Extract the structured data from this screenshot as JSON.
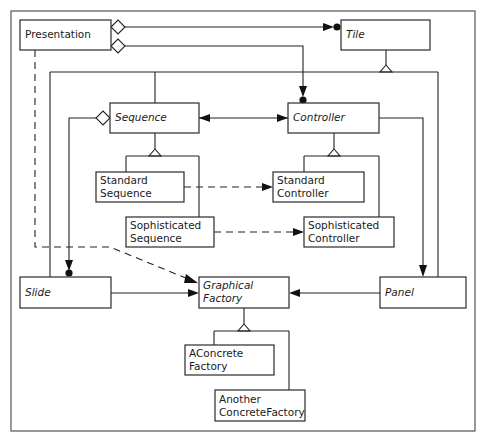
{
  "diagram": {
    "title": "",
    "classes": {
      "presentation": {
        "name": "Presentation",
        "abstract": false
      },
      "tile": {
        "name": "Tile",
        "abstract": true
      },
      "sequence": {
        "name": "Sequence",
        "abstract": true
      },
      "controller": {
        "name": "Controller",
        "abstract": true
      },
      "standard_sequence": {
        "line1": "Standard",
        "line2": "Sequence",
        "abstract": false
      },
      "sophisticated_sequence": {
        "line1": "Sophisticated",
        "line2": "Sequence",
        "abstract": false
      },
      "standard_controller": {
        "line1": "Standard",
        "line2": "Controller",
        "abstract": false
      },
      "sophisticated_controller": {
        "line1": "Sophisticated",
        "line2": "Controller",
        "abstract": false
      },
      "slide": {
        "name": "Slide",
        "abstract": true
      },
      "graphical_factory": {
        "line1": "Graphical",
        "line2": "Factory",
        "abstract": true
      },
      "panel": {
        "name": "Panel",
        "abstract": true
      },
      "aconcrete_factory": {
        "line1": "AConcrete",
        "line2": "Factory",
        "abstract": false
      },
      "another_concrete_factory": {
        "line1": "Another",
        "line2": "ConcreteFactory",
        "abstract": false
      }
    },
    "relationships": [
      {
        "type": "aggregation-many",
        "from": "Presentation",
        "to": "Tile"
      },
      {
        "type": "aggregation-many",
        "from": "Presentation",
        "to": "Controller"
      },
      {
        "type": "dependency",
        "from": "Presentation",
        "to": "Graphical Factory"
      },
      {
        "type": "generalization",
        "parent": "Tile",
        "children": [
          "Sequence",
          "Controller",
          "Slide",
          "Panel"
        ]
      },
      {
        "type": "association-bidirectional",
        "from": "Sequence",
        "to": "Controller"
      },
      {
        "type": "aggregation-many",
        "from": "Sequence",
        "to": "Slide"
      },
      {
        "type": "generalization",
        "parent": "Sequence",
        "children": [
          "Standard Sequence",
          "Sophisticated Sequence"
        ]
      },
      {
        "type": "generalization",
        "parent": "Controller",
        "children": [
          "Standard Controller",
          "Sophisticated Controller"
        ]
      },
      {
        "type": "dependency",
        "from": "Standard Sequence",
        "to": "Standard Controller"
      },
      {
        "type": "dependency",
        "from": "Sophisticated Sequence",
        "to": "Sophisticated Controller"
      },
      {
        "type": "association",
        "from": "Controller",
        "to": "Panel"
      },
      {
        "type": "association",
        "from": "Slide",
        "to": "Graphical Factory"
      },
      {
        "type": "association",
        "from": "Panel",
        "to": "Graphical Factory"
      },
      {
        "type": "generalization",
        "parent": "Graphical Factory",
        "children": [
          "AConcrete Factory",
          "Another ConcreteFactory"
        ]
      }
    ]
  }
}
